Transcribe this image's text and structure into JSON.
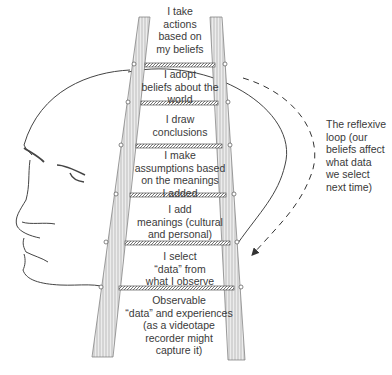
{
  "diagram": {
    "steps": [
      {
        "label": "I take\nactions\nbased on\nmy beliefs"
      },
      {
        "label": "I adopt\nbeliefs about the\nworld"
      },
      {
        "label": "I draw\nconclusions"
      },
      {
        "label": "I make\nassumptions based\non the meanings\nI added"
      },
      {
        "label": "I add\nmeanings (cultural\nand personal)"
      },
      {
        "label": "I select\n“data” from\nwhat I observe"
      },
      {
        "label": "Observable\n“data” and experiences\n(as a videotape\nrecorder might\ncapture it)"
      }
    ],
    "reflexive_loop": {
      "label": "The reflexive\nloop (our\nbeliefs affect\nwhat data\nwe select\nnext time)"
    },
    "figure_elements": [
      "head-profile",
      "ladder",
      "reflexive-loop-arrow"
    ],
    "colors": {
      "line": "#444444",
      "rail": "#bdbdbd",
      "text": "#3a3a3a"
    }
  },
  "caption": {
    "text": ""
  }
}
